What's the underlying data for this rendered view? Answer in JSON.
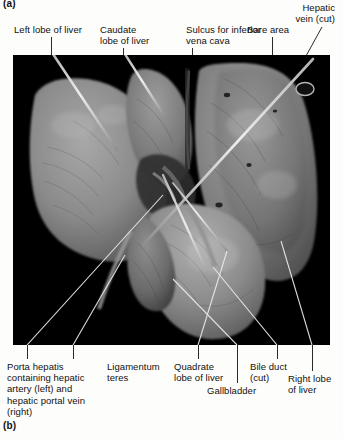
{
  "figure": {
    "panel_a_letter": "(a)",
    "panel_b_letter": "(b)",
    "view": "posterior-inferior visceral surface of liver",
    "photo_background_color": "#000000",
    "specimen_tone_color": "#7f7f7f",
    "page_background_color": "#fdfdfb",
    "text_color": "#111111",
    "leader_line_color": "#2b2b2b",
    "probe_color": "#e8e8e8"
  },
  "labels_top": [
    {
      "id": "left-lobe-of-liver",
      "text": "Left lobe of liver"
    },
    {
      "id": "caudate-lobe-of-liver",
      "text": "Caudate\nlobe of liver"
    },
    {
      "id": "sulcus-inferior-vena-cava",
      "text": "Sulcus for inferior\nvena cava"
    },
    {
      "id": "bare-area",
      "text": "Bare area"
    },
    {
      "id": "hepatic-vein-cut",
      "text": "Hepatic\nvein (cut)"
    }
  ],
  "labels_bottom": [
    {
      "id": "porta-hepatis",
      "text": "Porta hepatis\ncontaining hepatic\nartery (left) and\nhepatic portal vein\n(right)"
    },
    {
      "id": "ligamentum-teres",
      "text": "Ligamentum\nteres"
    },
    {
      "id": "quadrate-lobe-of-liver",
      "text": "Quadrate\nlobe of liver"
    },
    {
      "id": "gallbladder",
      "text": "Gallbladder"
    },
    {
      "id": "bile-duct-cut",
      "text": "Bile duct\n(cut)"
    },
    {
      "id": "right-lobe-of-liver",
      "text": "Right lobe\nof liver"
    }
  ]
}
